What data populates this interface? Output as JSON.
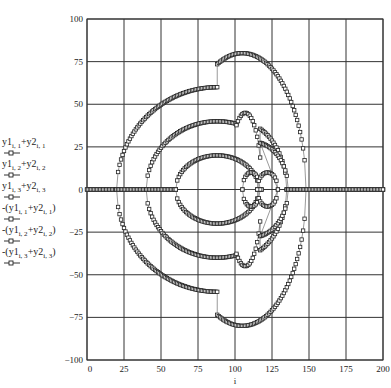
{
  "chart_data": {
    "type": "scatter",
    "title": "",
    "xlabel": "i",
    "ylabel": "",
    "xlim": [
      0,
      200
    ],
    "ylim": [
      -100,
      100
    ],
    "grid": true,
    "xticks": [
      "0",
      "25",
      "50",
      "75",
      "100",
      "125",
      "150",
      "175",
      "200"
    ],
    "xtick_values": [
      0,
      25,
      50,
      75,
      100,
      125,
      150,
      175,
      200
    ],
    "yticks": [
      "100",
      "75",
      "50",
      "25",
      "0",
      "−25",
      "−50",
      "−75",
      "−100"
    ],
    "ytick_values": [
      100,
      75,
      50,
      25,
      0,
      -25,
      -50,
      -75,
      -100
    ],
    "legend_position": "left",
    "legend": [
      {
        "base1": "y1",
        "sub1": "i, 1",
        "base2": "y2",
        "sub2": "i, 1",
        "negated": false
      },
      {
        "base1": "y1",
        "sub1": "i, 2",
        "base2": "y2",
        "sub2": "i, 2",
        "negated": false
      },
      {
        "base1": "y1",
        "sub1": "i, 3",
        "base2": "y2",
        "sub2": "i, 3",
        "negated": false
      },
      {
        "base1": "y1",
        "sub1": "i, 1",
        "base2": "y2",
        "sub2": "i, 1",
        "negated": true
      },
      {
        "base1": "y1",
        "sub1": "i, 2",
        "base2": "y2",
        "sub2": "i, 2",
        "negated": true
      },
      {
        "base1": "y1",
        "sub1": "i, 3",
        "base2": "y2",
        "sub2": "i, 3",
        "negated": true
      }
    ],
    "marker": "square",
    "series": [
      {
        "name": "y1[i,1]+y2[i,1]",
        "pieces": [
          {
            "shape": "flat",
            "from": 0,
            "to": 20,
            "value": 0
          },
          {
            "shape": "ellipse",
            "cx": 88,
            "rx": 68,
            "ry": 60,
            "from": 20,
            "to": 88
          },
          {
            "shape": "ellipse",
            "cx": 105,
            "rx": 43,
            "ry": 80,
            "from": 88,
            "to": 148
          },
          {
            "shape": "flat",
            "from": 148,
            "to": 200,
            "value": 0
          }
        ]
      },
      {
        "name": "y1[i,2]+y2[i,2]",
        "pieces": [
          {
            "shape": "flat",
            "from": 20,
            "to": 40,
            "value": 0
          },
          {
            "shape": "ellipse",
            "cx": 88,
            "rx": 48,
            "ry": 40,
            "from": 40,
            "to": 101
          },
          {
            "shape": "ellipse",
            "cx": 107,
            "rx": 11,
            "ry": 45,
            "from": 101,
            "to": 117
          },
          {
            "shape": "ellipse",
            "cx": 102,
            "rx": 33,
            "ry": 40,
            "from": 117,
            "to": 135
          },
          {
            "shape": "flat",
            "from": 135,
            "to": 148,
            "value": 0
          }
        ]
      },
      {
        "name": "y1[i,3]+y2[i,3]",
        "pieces": [
          {
            "shape": "flat",
            "from": 40,
            "to": 60,
            "value": 0
          },
          {
            "shape": "ellipse",
            "cx": 88,
            "rx": 28,
            "ry": 20,
            "from": 60,
            "to": 116
          },
          {
            "shape": "flat",
            "from": 116,
            "to": 118,
            "value": 0
          },
          {
            "shape": "ellipse",
            "cx": 111,
            "rx": 6,
            "ry": 10,
            "from": 105,
            "to": 117
          },
          {
            "shape": "ellipse",
            "cx": 122,
            "rx": 7,
            "ry": 10,
            "from": 115,
            "to": 129
          },
          {
            "shape": "ellipse",
            "cx": 112,
            "rx": 24,
            "ry": 28,
            "from": 117,
            "to": 136
          },
          {
            "shape": "flat",
            "from": 136,
            "to": 200,
            "value": 0
          }
        ]
      }
    ]
  }
}
